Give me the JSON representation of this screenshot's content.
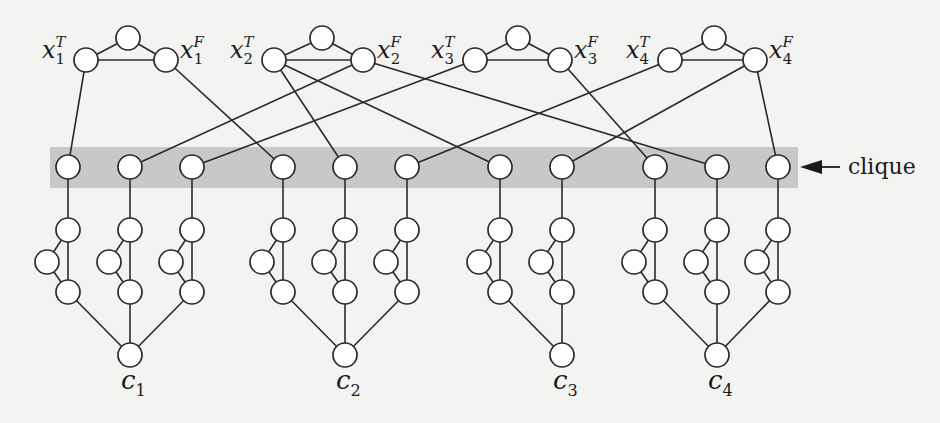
{
  "figure": {
    "band_color": "#c8c8c8",
    "line_color": "#2a2a2a",
    "node_fill": "#ffffff",
    "node_radius": 12
  },
  "clique_label": {
    "text": "clique",
    "arrow_icon": "left-arrow"
  },
  "variables": [
    {
      "name": "x",
      "index": "1",
      "true_label": {
        "base": "x",
        "sup": "T",
        "sub": "1"
      },
      "false_label": {
        "base": "x",
        "sup": "F",
        "sub": "1"
      },
      "T": [
        86,
        60
      ],
      "apex": [
        128,
        38
      ],
      "F": [
        166,
        60
      ]
    },
    {
      "name": "x",
      "index": "2",
      "true_label": {
        "base": "x",
        "sup": "T",
        "sub": "2"
      },
      "false_label": {
        "base": "x",
        "sup": "F",
        "sub": "2"
      },
      "T": [
        274,
        60
      ],
      "apex": [
        322,
        38
      ],
      "F": [
        363,
        60
      ]
    },
    {
      "name": "x",
      "index": "3",
      "true_label": {
        "base": "x",
        "sup": "T",
        "sub": "3"
      },
      "false_label": {
        "base": "x",
        "sup": "F",
        "sub": "3"
      },
      "T": [
        475,
        60
      ],
      "apex": [
        518,
        38
      ],
      "F": [
        560,
        60
      ]
    },
    {
      "name": "x",
      "index": "4",
      "true_label": {
        "base": "x",
        "sup": "T",
        "sub": "4"
      },
      "false_label": {
        "base": "x",
        "sup": "F",
        "sub": "4"
      },
      "T": [
        670,
        60
      ],
      "apex": [
        714,
        38
      ],
      "F": [
        755,
        60
      ]
    }
  ],
  "clique_band": {
    "x": 50,
    "y": 147,
    "width": 748,
    "height": 41
  },
  "clique_nodes": [
    {
      "x": 68,
      "source": {
        "var": 0,
        "lit": "T"
      },
      "clause": 0
    },
    {
      "x": 130,
      "source": {
        "var": 1,
        "lit": "F"
      },
      "clause": 0
    },
    {
      "x": 192,
      "source": {
        "var": 2,
        "lit": "T"
      },
      "clause": 0
    },
    {
      "x": 283,
      "source": {
        "var": 0,
        "lit": "F"
      },
      "clause": 1
    },
    {
      "x": 345,
      "source": {
        "var": 1,
        "lit": "T"
      },
      "clause": 1
    },
    {
      "x": 407,
      "source": {
        "var": 3,
        "lit": "T"
      },
      "clause": 1
    },
    {
      "x": 500,
      "source": {
        "var": 1,
        "lit": "T"
      },
      "clause": 2
    },
    {
      "x": 562,
      "source": {
        "var": 3,
        "lit": "F"
      },
      "clause": 2
    },
    {
      "x": 655,
      "source": {
        "var": 2,
        "lit": "F"
      },
      "clause": 3
    },
    {
      "x": 717,
      "source": {
        "var": 1,
        "lit": "F"
      },
      "clause": 3
    },
    {
      "x": 778,
      "source": {
        "var": 3,
        "lit": "F"
      },
      "clause": 3
    }
  ],
  "clique_row_y": 167,
  "gadget_rows": {
    "top_y": 230,
    "side_y": 262,
    "side_dx": -21,
    "bottom_y": 292
  },
  "clauses": [
    {
      "label": {
        "base": "c",
        "sub": "1"
      },
      "x": 130,
      "y": 355
    },
    {
      "label": {
        "base": "c",
        "sub": "2"
      },
      "x": 345,
      "y": 355
    },
    {
      "label": {
        "base": "c",
        "sub": "3"
      },
      "x": 562,
      "y": 355
    },
    {
      "label": {
        "base": "c",
        "sub": "4"
      },
      "x": 717,
      "y": 355
    }
  ]
}
